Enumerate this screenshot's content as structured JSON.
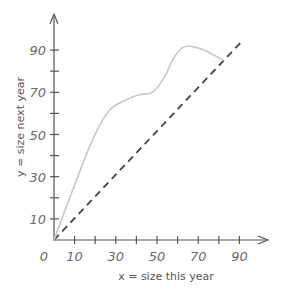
{
  "chart_data": {
    "type": "line",
    "title": "",
    "xlabel": "x = size this year",
    "ylabel": "y = size next year",
    "xlim": [
      0,
      100
    ],
    "ylim": [
      0,
      100
    ],
    "x_ticks": [
      10,
      20,
      30,
      40,
      50,
      60,
      70,
      80,
      90
    ],
    "x_tick_labels": [
      "10",
      "30",
      "50",
      "70",
      "90"
    ],
    "y_ticks": [
      10,
      20,
      30,
      40,
      50,
      60,
      70,
      80,
      90
    ],
    "y_tick_labels": [
      "10",
      "30",
      "50",
      "70",
      "90"
    ],
    "origin_label": "0",
    "grid": false,
    "legend": null,
    "series": [
      {
        "name": "growth curve",
        "style": "solid",
        "color": "#c8c8c8",
        "points": [
          [
            0,
            0
          ],
          [
            8,
            21
          ],
          [
            16.6,
            42.6
          ],
          [
            21.8,
            53.6
          ],
          [
            27,
            61.6
          ],
          [
            33,
            65.5
          ],
          [
            40.8,
            68.7
          ],
          [
            47.9,
            70.1
          ],
          [
            53.5,
            77
          ],
          [
            58,
            86
          ],
          [
            63,
            91.5
          ],
          [
            70,
            91
          ],
          [
            76,
            88.5
          ],
          [
            82,
            85.3
          ]
        ]
      },
      {
        "name": "y = x",
        "style": "dashed",
        "color": "#444444",
        "points": [
          [
            0,
            0
          ],
          [
            92,
            95
          ]
        ]
      }
    ]
  },
  "labels": {
    "x_axis": "x = size this year",
    "y_axis": "y = size next year",
    "origin": "0",
    "x_ticks": [
      "10",
      "30",
      "50",
      "70",
      "90"
    ],
    "y_ticks": [
      "10",
      "30",
      "50",
      "70",
      "90"
    ]
  },
  "colors": {
    "axis": "#555555",
    "curve": "#c8c8c8",
    "dashed": "#444444",
    "text": "#6a6a6a"
  }
}
